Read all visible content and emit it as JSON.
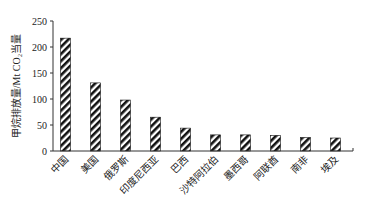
{
  "chart_data": {
    "type": "bar",
    "title": "",
    "xlabel": "",
    "ylabel": "甲烷排放量/Mt CO₂当量",
    "ylim": [
      0,
      250
    ],
    "yticks": [
      0,
      50,
      100,
      150,
      200,
      250
    ],
    "grid": false,
    "legend": null,
    "categories": [
      "中国",
      "美国",
      "俄罗斯",
      "印度尼西亚",
      "巴西",
      "沙特阿拉伯",
      "墨西哥",
      "阿联酋",
      "南非",
      "埃及"
    ],
    "values": [
      217,
      131,
      98,
      65,
      44,
      31,
      31,
      30,
      26,
      25
    ],
    "bar_style": "diagonal-hatch",
    "colors": {
      "bar_fill": "#000000",
      "bar_hatch_bg": "#ffffff",
      "axis": "#333333"
    }
  }
}
